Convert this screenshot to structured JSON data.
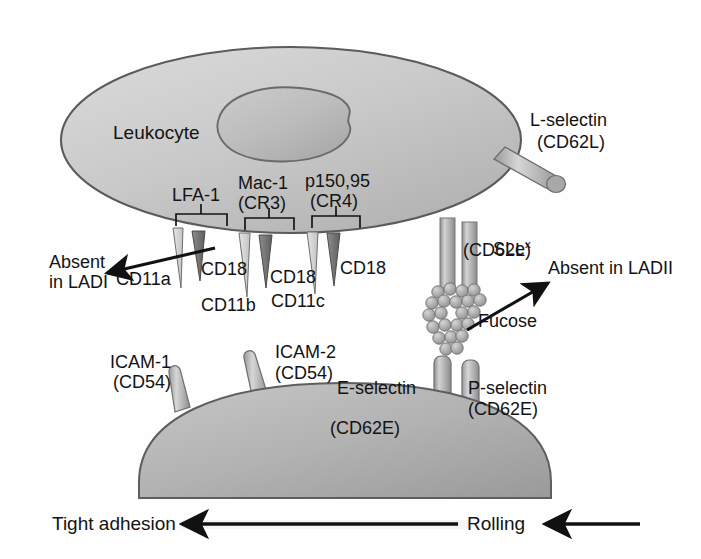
{
  "figure": {
    "domain_type": "biology-diagram",
    "background_color": "#ffffff",
    "ink_color": "#131313",
    "cell_fill_light": "#cfcfcf",
    "cell_fill_mid": "#b9b9b9",
    "cell_fill_dark": "#9a9a9a",
    "outline_color": "#55555a"
  },
  "cells": {
    "leukocyte_label": "Leukocyte",
    "endothelium_label": "Endothelium"
  },
  "integrins": [
    {
      "name": "LFA-1",
      "alt": "",
      "alpha_chain": "CD11a",
      "beta_chain": "CD18"
    },
    {
      "name": "Mac-1",
      "alt": "(CR3)",
      "alpha_chain": "CD11b",
      "beta_chain": "CD18"
    },
    {
      "name": "p150,95",
      "alt": "(CR4)",
      "alpha_chain": "CD11c",
      "beta_chain": "CD18"
    }
  ],
  "labels": {
    "lfa1": "LFA-1",
    "mac1_name": "Mac-1",
    "mac1_alt": "(CR3)",
    "p15095_name": "p150,95",
    "p15095_alt": "(CR4)",
    "cd11a": "CD11a",
    "cd11b": "CD11b",
    "cd11c": "CD11c",
    "cd18_a": "CD18",
    "cd18_b": "CD18",
    "cd18_c": "CD18",
    "absent_ladi_line1": "Absent",
    "absent_ladi_line2": "in LADI",
    "absent_ladii": "Absent in LADII",
    "fucose": "Fucose",
    "l_selectin_name": "L-selectin",
    "l_selectin_cd": "(CD62L)",
    "slex_base": "SLe",
    "slex_sup": "x",
    "slex_cd": "(CD62L)",
    "icam1_name": "ICAM-1",
    "icam1_cd": "(CD54)",
    "icam2_name": "ICAM-2",
    "icam2_cd": "(CD54)",
    "e_selectin_name": "E-selectin",
    "e_selectin_cd": "(CD62E)",
    "p_selectin_name": "P-selectin",
    "p_selectin_cd": "(CD62E)",
    "tight_adhesion": "Tight adhesion",
    "rolling": "Rolling"
  },
  "arrows": [
    {
      "name": "absent-in-ladi-arrow",
      "direction": "left",
      "points_to": "CD11a / CD18 integrin spikes"
    },
    {
      "name": "absent-in-ladii-arrow",
      "direction": "up-right",
      "points_to": "Absent in LADII"
    },
    {
      "name": "tight-adhesion-arrow",
      "direction": "left"
    },
    {
      "name": "rolling-arrow",
      "direction": "left"
    }
  ]
}
